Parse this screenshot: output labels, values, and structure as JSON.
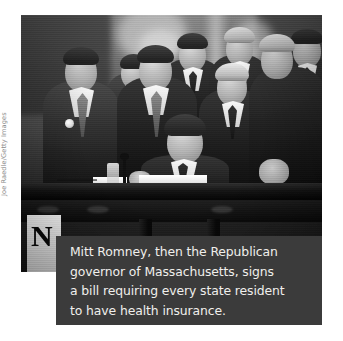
{
  "figure": {
    "type": "photograph",
    "medium": "black-and-white news photograph",
    "alt": "Mitt Romney seated at a desk signing a bill, surrounded by a group of men in dark suits standing behind him",
    "caption": "Mitt Romney, then the Republican\ngovernor of Massachusetts, signs\na bill requiring every state resident\nto have health insurance.",
    "caption_lines": [
      "Mitt Romney, then the Republican",
      "governor of Massachusetts, signs",
      "a bill requiring every state resident",
      "to have health insurance."
    ],
    "credit": "Joe Raedle/Getty Images",
    "colors": {
      "page_background": "#ffffff",
      "caption_background": "#3b3b3b",
      "caption_text": "#f0efec",
      "credit_text": "#8b8b8b"
    }
  }
}
